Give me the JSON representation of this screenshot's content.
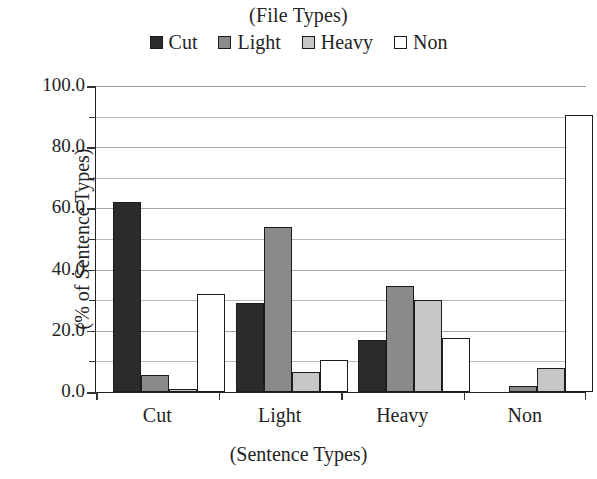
{
  "chart_data": {
    "type": "bar",
    "title": "(File Types)",
    "xlabel": "(Sentence Types)",
    "ylabel": "(% of Sentence Types)",
    "categories": [
      "Cut",
      "Light",
      "Heavy",
      "Non"
    ],
    "series": [
      {
        "name": "Cut",
        "color": "#2b2b2b",
        "values": [
          62.0,
          29.0,
          17.0,
          0.0
        ]
      },
      {
        "name": "Light",
        "color": "#8a8a8a",
        "values": [
          5.5,
          54.0,
          34.5,
          2.0
        ]
      },
      {
        "name": "Heavy",
        "color": "#c6c6c6",
        "values": [
          1.0,
          6.5,
          30.0,
          8.0
        ]
      },
      {
        "name": "Non",
        "color": "#ffffff",
        "values": [
          32.0,
          10.5,
          17.5,
          90.5
        ]
      }
    ],
    "ylim": [
      0.0,
      100.0
    ],
    "ytick_labels": [
      "0.0",
      "20.0",
      "40.0",
      "60.0",
      "80.0",
      "100.0"
    ],
    "ytick_values": [
      0,
      20,
      40,
      60,
      80,
      100
    ],
    "yminor_values": [
      10,
      30,
      50,
      70,
      90
    ],
    "grid": true,
    "legend_position": "top",
    "bar_border_color": "#1c1c1c",
    "axis_color": "#222222",
    "grid_color": "#b9b9b9"
  }
}
